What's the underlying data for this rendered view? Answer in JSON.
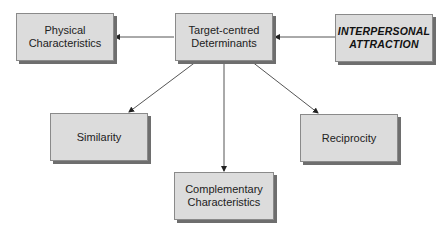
{
  "diagram": {
    "nodes": {
      "interpersonal": {
        "label": "INTERPERSONAL\nATTRACTION"
      },
      "target": {
        "label": "Target-centred\nDeterminants"
      },
      "physical": {
        "label": "Physical\nCharacteristics"
      },
      "similarity": {
        "label": "Similarity"
      },
      "complementary": {
        "label": "Complementary\nCharacteristics"
      },
      "reciprocity": {
        "label": "Reciprocity"
      }
    },
    "edges": [
      {
        "from": "interpersonal",
        "to": "target"
      },
      {
        "from": "target",
        "to": "physical"
      },
      {
        "from": "target",
        "to": "similarity"
      },
      {
        "from": "target",
        "to": "complementary"
      },
      {
        "from": "target",
        "to": "reciprocity"
      }
    ]
  }
}
